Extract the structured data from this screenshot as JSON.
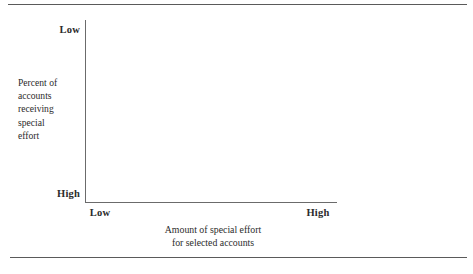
{
  "figure": {
    "background": "#ffffff",
    "ink_color": "#2b2b2b",
    "axis_color": "#6b6b6b",
    "rule_color": "#5a5a5a"
  },
  "chart_data": {
    "type": "scatter",
    "title": "",
    "subtitle": "",
    "note": "Empty two-by-two strategy framework grid; axes are drawn but no data points, bars, or lines are plotted.",
    "xlabel": "Amount of special effort\nfor selected accounts",
    "ylabel": "Percent of\naccounts\nreceiving\nspecial\neffort",
    "x_tick_labels": [
      "Low",
      "High"
    ],
    "y_tick_labels": [
      "Low",
      "High"
    ],
    "x_axis_direction": "Low at left, High at right",
    "y_axis_direction": "Low at top, High at bottom (inverted)",
    "grid": false,
    "legend": null,
    "series": [],
    "x": [],
    "values": []
  },
  "axes": {
    "y": {
      "scale_top_label": "Low",
      "scale_bottom_label": "High",
      "caption": "Percent of\naccounts\nreceiving\nspecial\neffort"
    },
    "x": {
      "scale_left_label": "Low",
      "scale_right_label": "High",
      "caption_line1": "Amount of special effort",
      "caption_line2": "for selected accounts",
      "caption": "Amount of special effort\nfor selected accounts"
    }
  }
}
